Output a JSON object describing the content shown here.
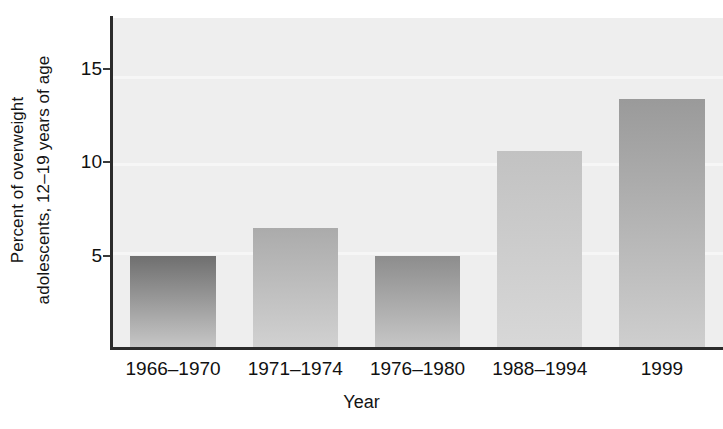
{
  "chart_data": {
    "type": "bar",
    "title": "",
    "categories": [
      "1966–1970",
      "1971–1974",
      "1976–1980",
      "1988–1994",
      "1999"
    ],
    "values": [
      5.0,
      6.5,
      5.0,
      10.6,
      13.4
    ],
    "xlabel": "Year",
    "ylabel_line1": "Percent of overweight",
    "ylabel_line2": "adolescents, 12–19 years of age",
    "ylim": [
      0,
      17.7
    ],
    "yticks": [
      5,
      10,
      15
    ],
    "ytick_labels": [
      "5",
      "10",
      "15"
    ],
    "grid": false,
    "legend": "none",
    "plot_background": "#eeeeee",
    "axis_color": "#2b2b2b",
    "bar_colors": [
      {
        "top": "#6f6f6f",
        "bottom": "#c9c9c9"
      },
      {
        "top": "#ababab",
        "bottom": "#d2d2d2"
      },
      {
        "top": "#8d8d8d",
        "bottom": "#c8c8c8"
      },
      {
        "top": "#c2c2c2",
        "bottom": "#d8d8d8"
      },
      {
        "top": "#9a9a9a",
        "bottom": "#cfcfcf"
      }
    ]
  },
  "axes": {
    "y_title_line1": "Percent of overweight",
    "y_title_line2": "adolescents, 12–19 years of age",
    "x_title": "Year"
  }
}
